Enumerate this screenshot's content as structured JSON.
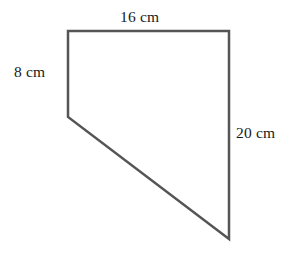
{
  "figure": {
    "name": "quadrilateral-dimension-diagram",
    "background_color": "#ffffff",
    "stroke_color": "#555555",
    "stroke_width": 2.5,
    "text_color": "#1a1a1a",
    "canvas": {
      "width": 305,
      "height": 253
    },
    "vertices": [
      {
        "name": "top-left",
        "x": 68,
        "y": 31
      },
      {
        "name": "top-right",
        "x": 229,
        "y": 31
      },
      {
        "name": "bottom-right",
        "x": 229,
        "y": 239
      },
      {
        "name": "left-middle",
        "x": 68,
        "y": 117
      }
    ],
    "polygon_points": "68,31 229,31 229,239 68,117",
    "labels": {
      "top": "16 cm",
      "left": "8 cm",
      "right": "20 cm"
    },
    "edges": [
      {
        "name": "top-edge",
        "label": "16 cm",
        "from": "top-left",
        "to": "top-right"
      },
      {
        "name": "left-edge",
        "label": "8 cm",
        "from": "top-left",
        "to": "left-middle"
      },
      {
        "name": "right-edge",
        "label": "20 cm",
        "from": "top-right",
        "to": "bottom-right"
      },
      {
        "name": "diagonal-edge",
        "label": "",
        "from": "left-middle",
        "to": "bottom-right"
      }
    ]
  }
}
